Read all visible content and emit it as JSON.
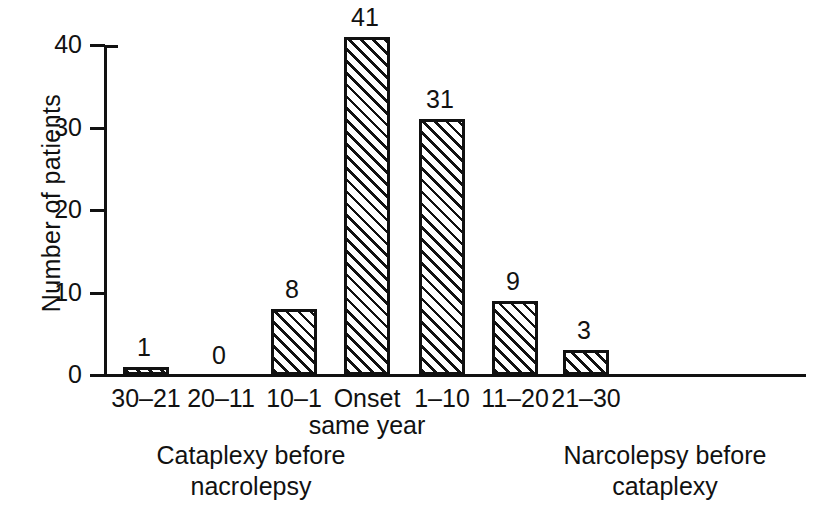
{
  "chart_data": {
    "type": "bar",
    "title": "",
    "xlabel": "",
    "ylabel": "Number of patients",
    "ylim": [
      0,
      41
    ],
    "yticks": [
      0,
      10,
      20,
      30,
      40
    ],
    "ytick_labels": [
      "0",
      "10",
      "20",
      "30",
      "40"
    ],
    "grid": false,
    "legend": "none",
    "categories": [
      "30–21",
      "20–11",
      "10–1",
      "Onset\nsame year",
      "1–10",
      "11–20",
      "21–30"
    ],
    "values": [
      1,
      0,
      8,
      41,
      31,
      9,
      3
    ],
    "value_labels": [
      "1",
      "0",
      "8",
      "41",
      "31",
      "9",
      "3"
    ],
    "bar_style": {
      "fill": "diagonal-hatch",
      "hatch_direction": "forward-45",
      "edge_color": "#111111",
      "face_color": "#ffffff"
    },
    "group_captions": [
      "Cataplexy before\nnacrolepsy",
      "Narcolepsy before\ncataplexy"
    ],
    "annotations": [
      "Bar for category 20–11 has value 0 and is not drawn."
    ]
  }
}
